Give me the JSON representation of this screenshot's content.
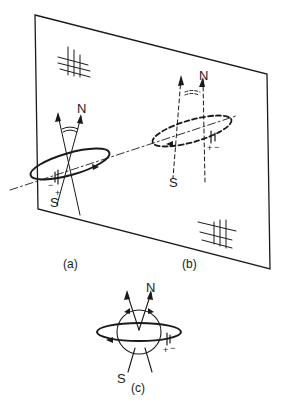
{
  "figure": {
    "panels": [
      {
        "id": "a",
        "label": "(a)",
        "north_label": "N",
        "south_label": "S",
        "ring_style": "solid",
        "battery_plus": "+",
        "battery_minus": "−"
      },
      {
        "id": "b",
        "label": "(b)",
        "north_label": "N",
        "south_label": "S",
        "ring_style": "dashed",
        "battery_plus": "+",
        "battery_minus": "−"
      },
      {
        "id": "c",
        "label": "(c)",
        "north_label": "N",
        "south_label": "S",
        "ring_style": "solid",
        "battery_plus": "+",
        "battery_minus": "−"
      }
    ],
    "mirror_plane": {
      "hatch_marks": 2
    },
    "colors": {
      "ink": "#1a1a1a",
      "background": "#ffffff"
    }
  }
}
